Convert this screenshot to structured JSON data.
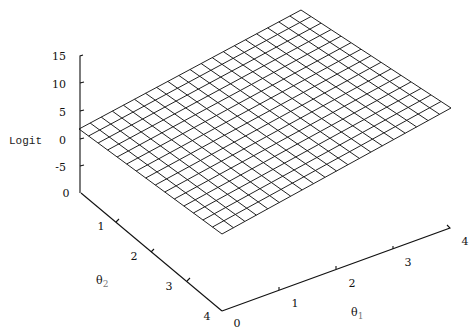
{
  "chart_data": {
    "type": "surface",
    "title": "",
    "zlabel": "Logit",
    "xlabel": "θ1",
    "ylabel": "θ2",
    "x_ticks": [
      "0",
      "1",
      "2",
      "3",
      "4"
    ],
    "y_ticks": [
      "0",
      "1",
      "2",
      "3",
      "4"
    ],
    "z_ticks": [
      "15",
      "10",
      "5",
      "0",
      "-5"
    ],
    "xlim": [
      0,
      4
    ],
    "ylim": [
      0,
      4
    ],
    "zlim": [
      -5,
      15
    ],
    "grid_cells": {
      "theta1": 20,
      "theta2": 15
    },
    "surface_corners": {
      "theta1_0_theta2_0": 3,
      "theta1_4_theta2_0": 15,
      "theta1_4_theta2_4": 10,
      "theta1_0_theta2_4": -3
    },
    "style": "wireframe mesh, black on white"
  },
  "labels": {
    "zlabel": "Logit",
    "xlabel_base": "θ",
    "xlabel_sub": "1",
    "ylabel_base": "θ",
    "ylabel_sub": "2"
  }
}
